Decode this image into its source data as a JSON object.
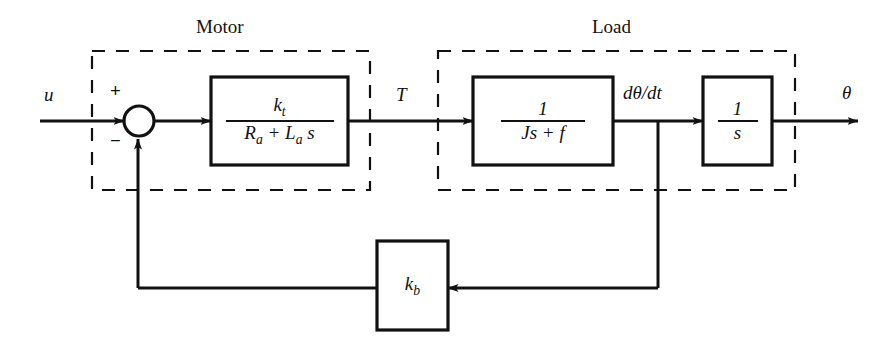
{
  "diagram": {
    "type": "control-system-block-diagram",
    "background_color": "#ffffff",
    "line_color": "#111111",
    "groups": [
      {
        "id": "motor",
        "label": "Motor",
        "label_x": 230,
        "label_y": 28,
        "x": 92,
        "y": 51,
        "w": 278,
        "h": 139
      },
      {
        "id": "load",
        "label": "Load",
        "label_x": 617,
        "label_y": 28,
        "x": 438,
        "y": 51,
        "w": 357,
        "h": 139
      }
    ],
    "blocks": [
      {
        "id": "motor-transfer",
        "numerator": "k",
        "numerator_sub": "t",
        "denominator": "R",
        "denominator_text": "Rₐ + Lₐs",
        "x": 211,
        "y": 77,
        "w": 137,
        "h": 88
      },
      {
        "id": "load-inertia",
        "numerator": "1",
        "denominator_text": "Js + f",
        "x": 473,
        "y": 77,
        "w": 140,
        "h": 88
      },
      {
        "id": "integrator",
        "numerator": "1",
        "denominator_text": "s",
        "x": 703,
        "y": 77,
        "w": 69,
        "h": 88
      },
      {
        "id": "back-emf",
        "label": "k",
        "label_sub": "b",
        "x": 377,
        "y": 241,
        "w": 71,
        "h": 89
      }
    ],
    "summing_junction": {
      "id": "summer",
      "cx": 139,
      "cy": 121,
      "r": 15,
      "plus_sign": "+",
      "minus_sign": "−",
      "plus_x": 114,
      "plus_y": 87,
      "minus_x": 114,
      "minus_y": 138
    },
    "signals": [
      {
        "id": "input-u",
        "label": "u",
        "x": 44,
        "y": 84
      },
      {
        "id": "torque-T",
        "label": "T",
        "x": 396,
        "y": 84
      },
      {
        "id": "velocity",
        "label": "dθ/dt",
        "x": 623,
        "y": 82
      },
      {
        "id": "output-theta",
        "label": "θ",
        "x": 842,
        "y": 82
      }
    ],
    "main_line_y": 121,
    "feedback_line_y": 288,
    "feedback_left_x": 138,
    "feedback_right_x": 658
  }
}
